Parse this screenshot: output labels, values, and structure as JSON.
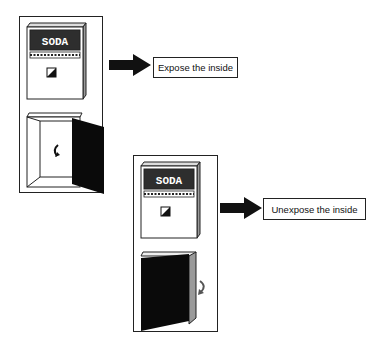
{
  "panels": [
    {
      "state": "door-open",
      "machine_sign": "SODA",
      "arrow_icon": "right-arrow-icon",
      "action_label": "Expose the inside",
      "rotation_icon": "rotate-counterclockwise-icon"
    },
    {
      "state": "door-closed",
      "machine_sign": "SODA",
      "arrow_icon": "right-arrow-icon",
      "action_label": "Unexpose the inside",
      "rotation_icon": "rotate-clockwise-icon"
    }
  ],
  "colors": {
    "frame": "#222222",
    "machine_body": "#ffffff",
    "machine_side": "#9a9a9a",
    "sign_bg": "#2e2e2e",
    "door": "#0a0a0a",
    "arrow": "#111111"
  }
}
